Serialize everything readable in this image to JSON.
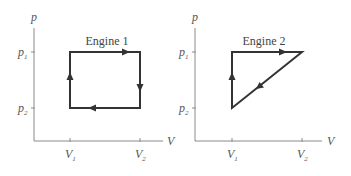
{
  "diagrams": [
    {
      "title": "Engine 1",
      "y_axis_label": "p",
      "x_axis_label": "V",
      "y_ticks": [
        {
          "base": "p",
          "sub": "1"
        },
        {
          "base": "p",
          "sub": "2"
        }
      ],
      "x_ticks": [
        {
          "base": "V",
          "sub": "1"
        },
        {
          "base": "V",
          "sub": "2"
        }
      ],
      "cycle_shape": "rectangle",
      "cycle_path": [
        "(V1,p2)",
        "(V1,p1)",
        "(V2,p1)",
        "(V2,p2)",
        "(V1,p2)"
      ],
      "direction": "clockwise"
    },
    {
      "title": "Engine 2",
      "y_axis_label": "p",
      "x_axis_label": "V",
      "y_ticks": [
        {
          "base": "p",
          "sub": "1"
        },
        {
          "base": "p",
          "sub": "2"
        }
      ],
      "x_ticks": [
        {
          "base": "V",
          "sub": "1"
        },
        {
          "base": "V",
          "sub": "2"
        }
      ],
      "cycle_shape": "triangle",
      "cycle_path": [
        "(V1,p2)",
        "(V1,p1)",
        "(V2,p1)",
        "(V1,p2)"
      ],
      "direction": "clockwise"
    }
  ],
  "colors": {
    "axis": "#8a8a8a",
    "cycle": "#333333",
    "text": "#555555"
  }
}
